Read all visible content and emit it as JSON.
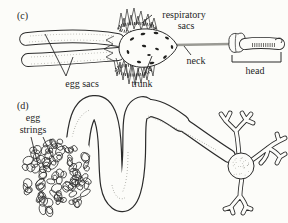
{
  "figure": {
    "colors": {
      "ink": "#2b2b2b",
      "paper": "#fcfcf9",
      "neck_gray": "#9a9a94",
      "stipple": "#888880"
    },
    "panel_c": {
      "tag": "(c)",
      "labels": {
        "respiratory_sacs": [
          "respiratory",
          "sacs"
        ],
        "egg_sacs": "egg sacs",
        "trunk": "trunk",
        "neck": "neck",
        "head": "head"
      }
    },
    "panel_d": {
      "tag": "(d)",
      "labels": {
        "egg_strings": [
          "egg",
          "strings"
        ]
      }
    }
  }
}
